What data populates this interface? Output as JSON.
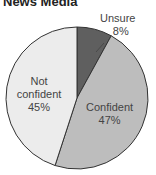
{
  "chart_data": {
    "type": "pie",
    "title": "News Media",
    "slices": [
      {
        "label": "Unsure",
        "value": 8,
        "display": "8%",
        "color": "#5f5f5f"
      },
      {
        "label": "Confident",
        "value": 47,
        "display": "47%",
        "color": "#bdbdbd"
      },
      {
        "label": "Not confident",
        "value": 45,
        "display": "45%",
        "color": "#ececec"
      }
    ]
  },
  "labels": {
    "unsure_name": "Unsure",
    "unsure_pct": "8%",
    "confident_name": "Confident",
    "confident_pct": "47%",
    "not_confident_line1": "Not",
    "not_confident_line2": "confident",
    "not_confident_pct": "45%"
  }
}
